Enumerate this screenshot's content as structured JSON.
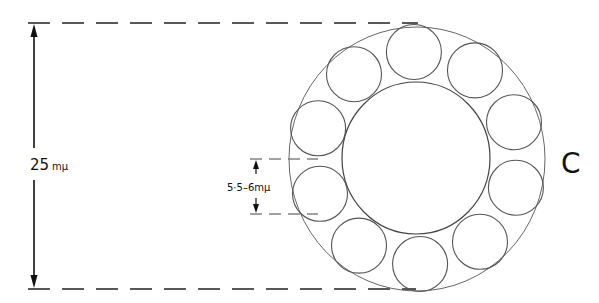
{
  "diagram": {
    "type": "cross-section schematic",
    "structure": "ring of subunits around a hollow core",
    "subunit_count": 10,
    "panel_label": "C",
    "dimensions": {
      "outer_diameter": {
        "label_value": "25",
        "label_unit": "mμ"
      },
      "subunit_diameter": {
        "label_text": "5·5–6mμ"
      }
    },
    "colors": {
      "line": "#444444",
      "text": "#111111",
      "background": "#ffffff"
    }
  }
}
